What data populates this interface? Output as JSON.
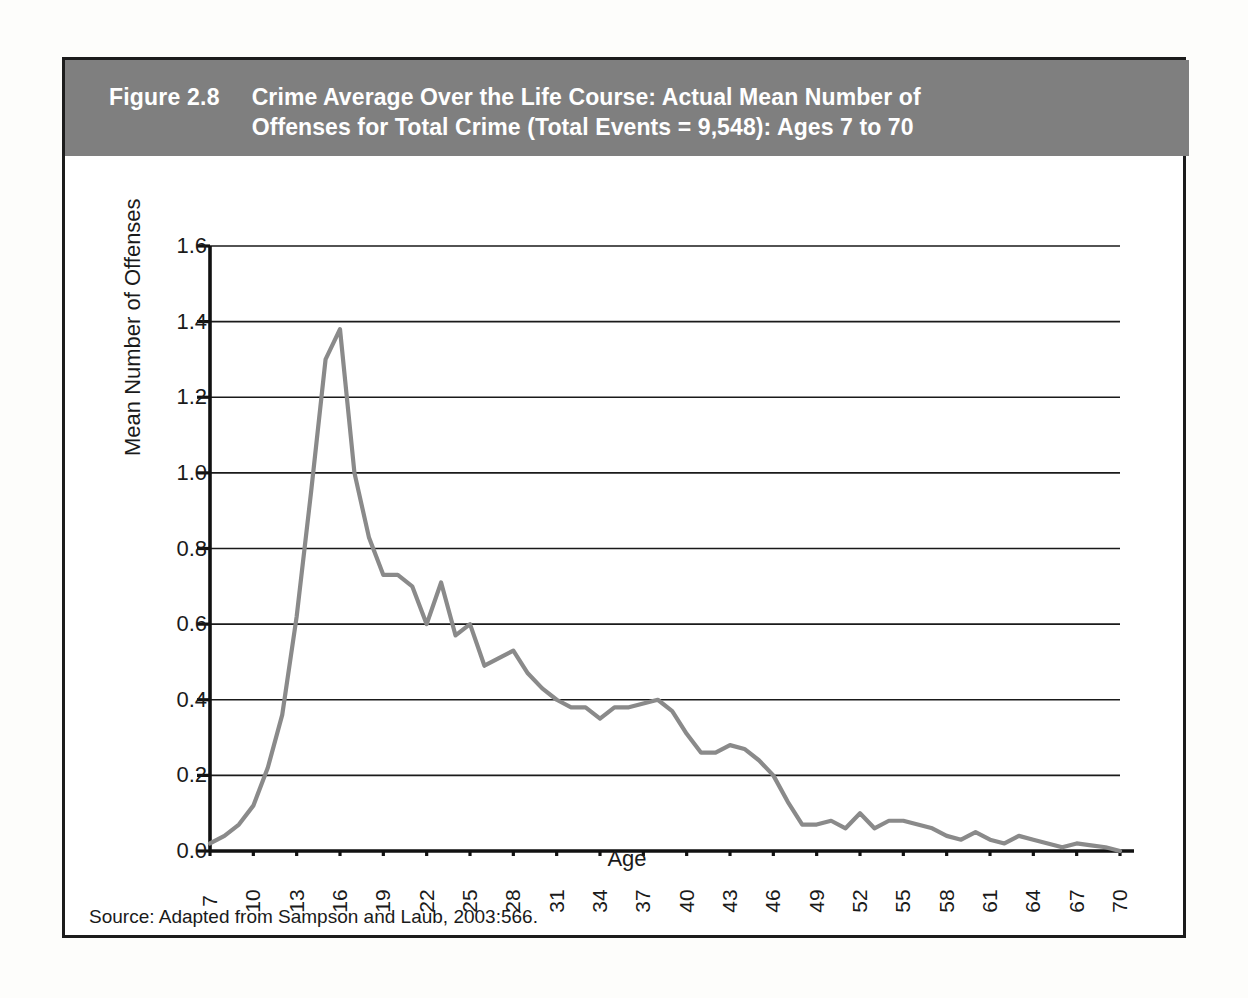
{
  "figure": {
    "number": "Figure 2.8",
    "title": "Crime Average Over the Life Course: Actual Mean Number of Offenses for Total Crime (Total Events = 9,548): Ages 7 to 70",
    "title_line1": "Crime Average Over the Life Course: Actual Mean Number of",
    "title_line2": "Offenses for Total Crime (Total Events = 9,548): Ages 7 to 70",
    "source": "Source: Adapted from Sampson and Laub, 2003:566.",
    "band_color": "#7f7f7f",
    "border_color": "#1c1c1c"
  },
  "chart_data": {
    "type": "line",
    "title": "Crime Average Over the Life Course: Actual Mean Number of Offenses for Total Crime (Total Events = 9,548): Ages 7 to 70",
    "xlabel": "Age",
    "ylabel": "Mean Number of Offenses",
    "xlim": [
      7,
      70
    ],
    "ylim": [
      0.0,
      1.6
    ],
    "grid": true,
    "legend": "none",
    "line_color": "#8a8a8a",
    "ytick_labels": [
      "0.0",
      "0.2",
      "0.4",
      "0.6",
      "0.8",
      "1.0",
      "1.2",
      "1.4",
      "1.6"
    ],
    "ytick_values": [
      0.0,
      0.2,
      0.4,
      0.6,
      0.8,
      1.0,
      1.2,
      1.4,
      1.6
    ],
    "xtick_labels": [
      "7",
      "10",
      "13",
      "16",
      "19",
      "22",
      "25",
      "28",
      "31",
      "34",
      "37",
      "40",
      "43",
      "46",
      "49",
      "52",
      "55",
      "58",
      "61",
      "64",
      "67",
      "70"
    ],
    "xtick_values": [
      7,
      10,
      13,
      16,
      19,
      22,
      25,
      28,
      31,
      34,
      37,
      40,
      43,
      46,
      49,
      52,
      55,
      58,
      61,
      64,
      67,
      70
    ],
    "x": [
      7,
      8,
      9,
      10,
      11,
      12,
      13,
      14,
      15,
      16,
      17,
      18,
      19,
      20,
      21,
      22,
      23,
      24,
      25,
      26,
      27,
      28,
      29,
      30,
      31,
      32,
      33,
      34,
      35,
      36,
      37,
      38,
      39,
      40,
      41,
      42,
      43,
      44,
      45,
      46,
      47,
      48,
      49,
      50,
      51,
      52,
      53,
      54,
      55,
      56,
      57,
      58,
      59,
      60,
      61,
      62,
      63,
      64,
      65,
      66,
      67,
      68,
      69,
      70
    ],
    "y": [
      0.02,
      0.04,
      0.07,
      0.12,
      0.22,
      0.36,
      0.62,
      0.95,
      1.3,
      1.38,
      1.0,
      0.83,
      0.73,
      0.73,
      0.7,
      0.6,
      0.71,
      0.57,
      0.6,
      0.49,
      0.51,
      0.53,
      0.47,
      0.43,
      0.4,
      0.38,
      0.38,
      0.35,
      0.38,
      0.38,
      0.39,
      0.4,
      0.37,
      0.31,
      0.26,
      0.26,
      0.28,
      0.27,
      0.24,
      0.2,
      0.13,
      0.07,
      0.07,
      0.08,
      0.06,
      0.1,
      0.06,
      0.08,
      0.08,
      0.07,
      0.06,
      0.04,
      0.03,
      0.05,
      0.03,
      0.02,
      0.04,
      0.03,
      0.02,
      0.01,
      0.02,
      0.015,
      0.01,
      0.0
    ],
    "series": [
      {
        "name": "Total Crime",
        "values": [
          0.02,
          0.04,
          0.07,
          0.12,
          0.22,
          0.36,
          0.62,
          0.95,
          1.3,
          1.38,
          1.0,
          0.83,
          0.73,
          0.73,
          0.7,
          0.6,
          0.71,
          0.57,
          0.6,
          0.49,
          0.51,
          0.53,
          0.47,
          0.43,
          0.4,
          0.38,
          0.38,
          0.35,
          0.38,
          0.38,
          0.39,
          0.4,
          0.37,
          0.31,
          0.26,
          0.26,
          0.28,
          0.27,
          0.24,
          0.2,
          0.13,
          0.07,
          0.07,
          0.08,
          0.06,
          0.1,
          0.06,
          0.08,
          0.08,
          0.07,
          0.06,
          0.04,
          0.03,
          0.05,
          0.03,
          0.02,
          0.04,
          0.03,
          0.02,
          0.01,
          0.02,
          0.015,
          0.01,
          0.0
        ]
      }
    ],
    "peak": {
      "age": 16,
      "value": 1.38
    },
    "total_events": "9,548"
  }
}
